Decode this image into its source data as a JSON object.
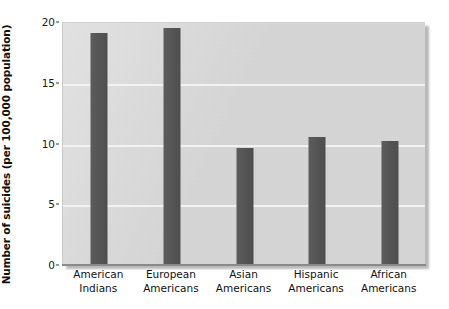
{
  "chart_data": {
    "type": "bar",
    "title": "",
    "xlabel": "",
    "ylabel": "Number of suicides (per 100,000 population)",
    "categories": [
      "American\nIndians",
      "European\nAmericans",
      "Asian\nAmericans",
      "Hispanic\nAmericans",
      "African\nAmericans"
    ],
    "category_lines": [
      [
        "American",
        "Indians"
      ],
      [
        "European",
        "Americans"
      ],
      [
        "Asian",
        "Americans"
      ],
      [
        "Hispanic",
        "Americans"
      ],
      [
        "African",
        "Americans"
      ]
    ],
    "values": [
      19.1,
      19.5,
      9.6,
      10.5,
      10.2
    ],
    "ylim": [
      0,
      20
    ],
    "yticks": [
      0,
      5,
      10,
      15,
      20
    ],
    "ytick_labels": [
      "0",
      "5",
      "10",
      "15",
      "20"
    ],
    "gridlines": [
      5,
      10,
      15
    ],
    "grid": true,
    "legend": "none",
    "bar_color": "#555555",
    "panel_color": "#d7d7d7",
    "gridline_color": "#f2f2f2",
    "axis_color": "#8a8a8a"
  },
  "figure": {
    "background": "#ffffff"
  }
}
